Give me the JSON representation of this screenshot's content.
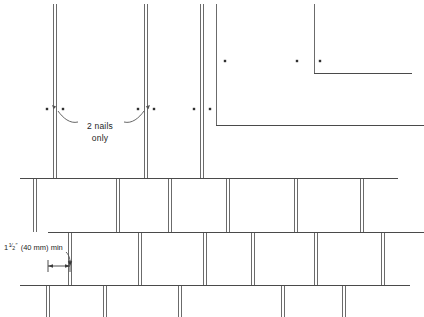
{
  "drawing": {
    "title": "Shingle Nailing and Joint Offset Detail",
    "width": 424,
    "height": 317,
    "background_color": "#ffffff",
    "line_color": "#4a4a4a",
    "joint_color": "#6b6b6b",
    "nail_color": "#303030"
  },
  "annotations": {
    "nails_note_line1": "2 nails",
    "nails_note_line2": "only",
    "nails_note_x": 100,
    "nails_note_y1": 129,
    "nails_note_y2": 141,
    "dimension": {
      "whole": "1",
      "numerator": "1",
      "denominator": "2",
      "unit_mark": "″",
      "metric": "(40 mm)",
      "qualifier": "min",
      "full_text": "1 1/2″ (40 mm) min",
      "text_x": 4,
      "text_y": 250,
      "arrow_y": 266,
      "arrow_x_start": 48,
      "arrow_x_end": 70
    }
  },
  "geometry": {
    "course_lines": [
      {
        "name": "upper-right-course",
        "x1": 314,
        "y1": 73,
        "x2": 412,
        "y2": 73
      },
      {
        "name": "right-step-course",
        "x1": 216,
        "y1": 125,
        "x2": 424,
        "y2": 125
      },
      {
        "name": "third-course",
        "x1": 20,
        "y1": 178,
        "x2": 398,
        "y2": 178
      },
      {
        "name": "fourth-course",
        "x1": 48,
        "y1": 232,
        "x2": 424,
        "y2": 232
      },
      {
        "name": "bottom-course",
        "x1": 20,
        "y1": 285,
        "x2": 410,
        "y2": 285
      }
    ],
    "vertical_joints": [
      {
        "name": "joint-top-a",
        "x": 55,
        "y1": 4,
        "y2": 178,
        "double": true
      },
      {
        "name": "joint-top-b",
        "x": 146,
        "y1": 4,
        "y2": 178,
        "double": true
      },
      {
        "name": "joint-top-c",
        "x": 202,
        "y1": 4,
        "y2": 178,
        "double": true
      },
      {
        "name": "joint-top-d",
        "x": 216,
        "y1": 4,
        "y2": 125,
        "double": false
      },
      {
        "name": "joint-top-e",
        "x": 314,
        "y1": 4,
        "y2": 73,
        "double": false
      },
      {
        "name": "joint-mid-a",
        "x": 35,
        "y1": 178,
        "y2": 232,
        "double": true
      },
      {
        "name": "joint-mid-b",
        "x": 118,
        "y1": 178,
        "y2": 232,
        "double": true
      },
      {
        "name": "joint-mid-c",
        "x": 170,
        "y1": 178,
        "y2": 232,
        "double": true
      },
      {
        "name": "joint-mid-d",
        "x": 228,
        "y1": 178,
        "y2": 232,
        "double": true
      },
      {
        "name": "joint-mid-e",
        "x": 296,
        "y1": 178,
        "y2": 232,
        "double": true
      },
      {
        "name": "joint-mid-f",
        "x": 362,
        "y1": 178,
        "y2": 232,
        "double": true
      },
      {
        "name": "joint-low-a",
        "x": 70,
        "y1": 232,
        "y2": 285,
        "double": true
      },
      {
        "name": "joint-low-b",
        "x": 140,
        "y1": 232,
        "y2": 285,
        "double": true
      },
      {
        "name": "joint-low-c",
        "x": 205,
        "y1": 232,
        "y2": 285,
        "double": true
      },
      {
        "name": "joint-low-d",
        "x": 253,
        "y1": 232,
        "y2": 285,
        "double": true
      },
      {
        "name": "joint-low-e",
        "x": 316,
        "y1": 232,
        "y2": 285,
        "double": true
      },
      {
        "name": "joint-low-f",
        "x": 383,
        "y1": 232,
        "y2": 285,
        "double": true
      },
      {
        "name": "joint-bottom-a",
        "x": 48,
        "y1": 285,
        "y2": 317,
        "double": true
      },
      {
        "name": "joint-bottom-b",
        "x": 105,
        "y1": 285,
        "y2": 317,
        "double": true
      },
      {
        "name": "joint-bottom-c",
        "x": 180,
        "y1": 285,
        "y2": 317,
        "double": true
      },
      {
        "name": "joint-bottom-d",
        "x": 283,
        "y1": 285,
        "y2": 317,
        "double": true
      },
      {
        "name": "joint-bottom-e",
        "x": 344,
        "y1": 285,
        "y2": 317,
        "double": true
      }
    ],
    "nails": [
      {
        "name": "nail-1",
        "x": 47,
        "y": 109
      },
      {
        "name": "nail-2",
        "x": 63,
        "y": 109
      },
      {
        "name": "nail-3",
        "x": 138,
        "y": 109
      },
      {
        "name": "nail-4",
        "x": 154,
        "y": 109
      },
      {
        "name": "nail-5",
        "x": 194,
        "y": 109
      },
      {
        "name": "nail-6",
        "x": 210,
        "y": 109
      },
      {
        "name": "nail-7",
        "x": 225,
        "y": 61
      },
      {
        "name": "nail-8",
        "x": 297,
        "y": 61
      },
      {
        "name": "nail-9",
        "x": 320,
        "y": 61
      }
    ],
    "leaders": [
      {
        "name": "leader-left",
        "path": "M 78 122 C 70 124 63 118 58 111"
      },
      {
        "name": "leader-right",
        "path": "M 124 122 C 132 124 139 118 144 111"
      }
    ]
  }
}
